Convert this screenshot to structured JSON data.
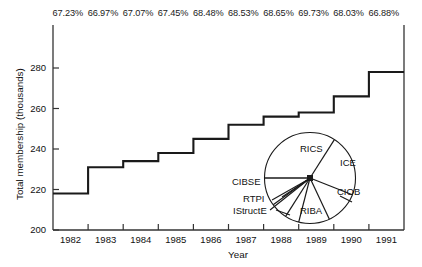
{
  "chart_data": {
    "type": "line",
    "title": "",
    "subtitle": "",
    "xlabel": "Year",
    "ylabel": "Total membership (thousands)",
    "xlim": [
      1982,
      1992
    ],
    "ylim": [
      200,
      290
    ],
    "grid": false,
    "legend_position": "none",
    "style": "step",
    "x_tick_labels": [
      "1982",
      "1983",
      "1984",
      "1985",
      "1986",
      "1987",
      "1988",
      "1989",
      "1990",
      "1991"
    ],
    "y_tick_labels": [
      "200",
      "220",
      "240",
      "260",
      "280"
    ],
    "y_ticks": [
      200,
      220,
      240,
      260,
      280
    ],
    "categories": [
      "1982",
      "1983",
      "1984",
      "1985",
      "1986",
      "1987",
      "1988",
      "1989",
      "1990",
      "1991"
    ],
    "values": [
      218,
      231,
      234,
      238,
      245,
      252,
      256,
      258,
      266,
      278
    ],
    "series": [
      {
        "name": "Total membership (thousands)",
        "values": [
          218,
          231,
          234,
          238,
          245,
          252,
          256,
          258,
          266,
          278
        ]
      }
    ],
    "annotations": {
      "name": "percentage-labels",
      "description": "Percentage shown above each year step",
      "values": [
        "67.23%",
        "66.97%",
        "67.07%",
        "67.45%",
        "68.48%",
        "68.53%",
        "68.65%",
        "69.73%",
        "68.03%",
        "66.88%"
      ]
    },
    "inset_chart": {
      "type": "pie",
      "title": "",
      "labels": [
        "RICS",
        "ICE",
        "CIOB",
        "RIBA",
        "IStructE",
        "RTPI",
        "CIBSE"
      ],
      "values": [
        34,
        22,
        12,
        11,
        5,
        6,
        10
      ]
    }
  },
  "axes": {
    "y_title": "Total membership (thousands)",
    "x_title": "Year"
  },
  "colors": {
    "line": "#1a1a1a",
    "axis": "#333333",
    "text": "#111111",
    "background": "#ffffff"
  }
}
